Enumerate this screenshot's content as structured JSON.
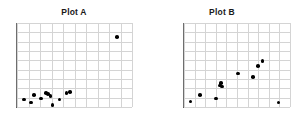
{
  "figure": {
    "background_color": "#ffffff",
    "point_color": "#000000",
    "grid_color": "#d4d4d4",
    "axis_color": "#4a4a4a"
  },
  "panels": [
    {
      "title": "Plot A"
    },
    {
      "title": "Plot B"
    }
  ],
  "chart_data": [
    {
      "type": "scatter",
      "title": "Plot A",
      "xlabel": "",
      "ylabel": "",
      "xlim": [
        0,
        10
      ],
      "ylim": [
        0,
        9
      ],
      "grid": true,
      "legend": "none",
      "xticks": [
        0,
        1,
        2,
        3,
        4,
        5,
        6,
        7,
        8,
        9,
        10
      ],
      "yticks": [
        0,
        1,
        2,
        3,
        4,
        5,
        6,
        7,
        8,
        9
      ],
      "xticklabels": [],
      "yticklabels": [],
      "series": [
        {
          "name": "Plot A points",
          "points": [
            [
              0.6,
              0.8
            ],
            [
              1.2,
              0.5
            ],
            [
              1.5,
              1.3
            ],
            [
              2.1,
              0.9
            ],
            [
              2.5,
              1.5
            ],
            [
              2.7,
              1.4
            ],
            [
              2.9,
              1.2
            ],
            [
              3.1,
              0.2
            ],
            [
              3.7,
              0.8
            ],
            [
              4.3,
              1.5
            ],
            [
              4.6,
              1.6
            ],
            [
              8.7,
              7.5
            ]
          ]
        }
      ],
      "annotations": [
        "One extreme outlier in the upper right; remaining points clustered near the lower left."
      ]
    },
    {
      "type": "scatter",
      "title": "Plot B",
      "xlabel": "",
      "ylabel": "",
      "xlim": [
        0,
        10
      ],
      "ylim": [
        0,
        9
      ],
      "grid": true,
      "legend": "none",
      "xticks": [
        0,
        1,
        2,
        3,
        4,
        5,
        6,
        7,
        8,
        9,
        10
      ],
      "yticks": [
        0,
        1,
        2,
        3,
        4,
        5,
        6,
        7,
        8,
        9
      ],
      "xticklabels": [],
      "yticklabels": [],
      "series": [
        {
          "name": "Plot B points",
          "points": [
            [
              0.6,
              0.6
            ],
            [
              1.5,
              1.3
            ],
            [
              3.0,
              0.9
            ],
            [
              3.4,
              2.3
            ],
            [
              3.5,
              2.6
            ],
            [
              3.6,
              2.2
            ],
            [
              5.1,
              3.6
            ],
            [
              6.5,
              3.2
            ],
            [
              7.0,
              4.4
            ],
            [
              7.4,
              4.9
            ],
            [
              8.9,
              0.5
            ]
          ]
        }
      ],
      "annotations": [
        "Positive increasing trend with a single low outlier at the far right."
      ]
    }
  ]
}
